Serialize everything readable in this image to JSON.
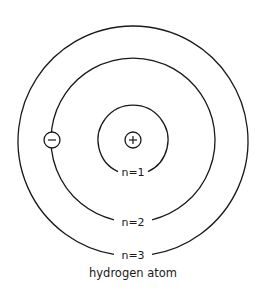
{
  "diagram": {
    "caption": "hydrogen atom",
    "center": {
      "x": 133,
      "y": 140
    },
    "stroke_color": "#1a1a1a",
    "nucleus": {
      "symbol": "+",
      "label": "proton",
      "radius": 8
    },
    "electron": {
      "symbol": "−",
      "label": "electron",
      "orbit": "n=2",
      "radius": 8
    },
    "orbits": [
      {
        "label": "n=1",
        "n": 1,
        "radius": 35
      },
      {
        "label": "n=2",
        "n": 2,
        "radius": 82
      },
      {
        "label": "n=3",
        "n": 3,
        "radius": 115
      }
    ]
  }
}
